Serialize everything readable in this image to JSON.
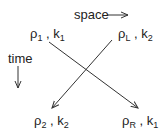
{
  "axes": {
    "space_label": "space",
    "time_label": "time"
  },
  "nodes": {
    "top_left": {
      "rho": "ρ",
      "rho_sub": "1",
      "sep": " , ",
      "k": "k",
      "k_sub": "1"
    },
    "top_right": {
      "rho": "ρ",
      "rho_sub": "L",
      "sep": " , ",
      "k": "k",
      "k_sub": "2"
    },
    "bottom_left": {
      "rho": "ρ",
      "rho_sub": "2",
      "sep": " , ",
      "k": "k",
      "k_sub": "2"
    },
    "bottom_right": {
      "rho": "ρ",
      "rho_sub": "R",
      "sep": " , ",
      "k": "k",
      "k_sub": "1"
    }
  },
  "colors": {
    "line": "#333333"
  }
}
